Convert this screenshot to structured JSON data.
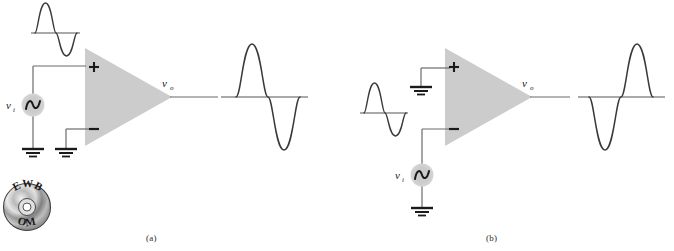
{
  "figure": {
    "background_color": "#ffffff",
    "wire_color": "#666666",
    "trace_color": "#3a3a3a",
    "body_fill": "#cccccc",
    "source_fill": "#cccccc",
    "text_color": "#1a1a1a",
    "panels": [
      {
        "id": "a",
        "caption": "(a)",
        "description": "Non-inverting: input applied to plus terminal, inverting terminal grounded, output in phase with input",
        "opamp": {
          "plus_label": "+",
          "minus_label": "−",
          "output_label": "v",
          "output_label_sub": "o"
        },
        "source": {
          "label": "v",
          "label_sub": "i",
          "symbol": "ac-sine-source",
          "connected_terminal": "+"
        },
        "grounds": 2,
        "input_waveform": {
          "name": "input-sine",
          "phase": "positive-first",
          "cycles": 1
        },
        "output_waveform": {
          "name": "output-sine",
          "phase": "positive-first",
          "cycles": 1,
          "relationship": "in-phase"
        }
      },
      {
        "id": "b",
        "caption": "(b)",
        "description": "Inverting: input applied to minus terminal, non-inverting terminal grounded, output 180 degrees out of phase with input",
        "opamp": {
          "plus_label": "+",
          "minus_label": "−",
          "output_label": "v",
          "output_label_sub": "o"
        },
        "source": {
          "label": "v",
          "label_sub": "i",
          "symbol": "ac-sine-source",
          "connected_terminal": "−"
        },
        "grounds": 2,
        "input_waveform": {
          "name": "input-sine",
          "phase": "positive-first",
          "cycles": 1
        },
        "output_waveform": {
          "name": "output-sine",
          "phase": "negative-first",
          "cycles": 1,
          "relationship": "inverted"
        }
      }
    ],
    "media_badge": {
      "name": "ewb-cd-icon",
      "top_text": "EWB",
      "bottom_text": "OM",
      "shape": "compact-disc"
    }
  }
}
